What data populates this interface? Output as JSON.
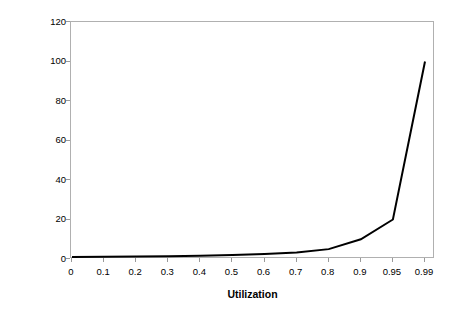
{
  "chart_data": {
    "type": "line",
    "title": "",
    "xlabel": "Utilization",
    "ylabel": "Response Time / Service Time",
    "categories": [
      "0",
      "0.1",
      "0.2",
      "0.3",
      "0.4",
      "0.5",
      "0.6",
      "0.7",
      "0.8",
      "0.9",
      "0.95",
      "0.99"
    ],
    "values": [
      1,
      1.11,
      1.25,
      1.43,
      1.67,
      2,
      2.5,
      3.33,
      5,
      10,
      20,
      100
    ],
    "series": [
      {
        "name": "Response Time / Service Time",
        "values": [
          1,
          1.11,
          1.25,
          1.43,
          1.67,
          2,
          2.5,
          3.33,
          5,
          10,
          20,
          100
        ]
      }
    ],
    "yticks": [
      0,
      20,
      40,
      60,
      80,
      100,
      120
    ],
    "ylim": [
      0,
      120
    ],
    "grid": false,
    "legend": false,
    "line_color": "#000000",
    "frame_color": "#b0b0b0"
  }
}
